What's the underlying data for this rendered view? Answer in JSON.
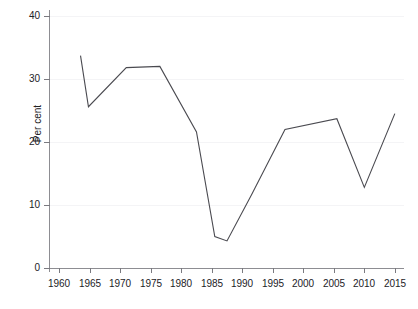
{
  "chart_data": {
    "type": "line",
    "title": "",
    "subtitle": "",
    "xlabel": "",
    "ylabel": "Per cent",
    "xlim": [
      1958.5,
      2016.5
    ],
    "ylim": [
      0,
      40
    ],
    "grid": true,
    "grid_axis": "y",
    "legend": false,
    "legend_position": "none",
    "line_color": "#4a4a50",
    "x_ticks": [
      1960,
      1965,
      1970,
      1975,
      1980,
      1985,
      1990,
      1995,
      2000,
      2005,
      2010,
      2015
    ],
    "x_tick_labels": [
      "1960",
      "1965",
      "1970",
      "1975",
      "1980",
      "1985",
      "1990",
      "1995",
      "2000",
      "2005",
      "2010",
      "2015"
    ],
    "y_ticks": [
      0,
      10,
      20,
      30,
      40
    ],
    "y_tick_labels": [
      "0",
      "10",
      "20",
      "30",
      "40"
    ],
    "series": [
      {
        "name": "Per cent",
        "x": [
          1963.5,
          1964.8,
          1971.0,
          1976.5,
          1982.5,
          1985.5,
          1987.5,
          1991.5,
          1997.0,
          2005.5,
          2010.0,
          2015.0
        ],
        "values": [
          33.7,
          25.6,
          31.8,
          32.0,
          21.6,
          5.0,
          4.3,
          11.6,
          22.0,
          23.7,
          12.8,
          24.5
        ]
      }
    ],
    "annotations": []
  },
  "axes": {
    "y_label": "Per cent"
  },
  "ghost_text": {
    "top_fragment": ""
  }
}
